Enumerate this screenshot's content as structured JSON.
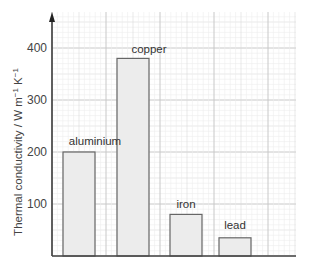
{
  "chart_data": {
    "type": "bar",
    "title": "",
    "xlabel": "",
    "ylabel": "Thermal conductivity / W m⁻¹ K⁻¹",
    "categories": [
      "aluminium",
      "copper",
      "iron",
      "lead"
    ],
    "values": [
      200,
      380,
      80,
      35
    ],
    "yticks": [
      100,
      200,
      300,
      400
    ],
    "ylim": [
      0,
      460
    ],
    "grid": true,
    "grid_style": "graph paper (major every 100, minor every 10)",
    "bar_color": "#ececec",
    "bar_edge_color": "#666666",
    "legend": null
  },
  "labels": {
    "ylabel_main": "Thermal conductivity / W m",
    "ylabel_exp1": "−1",
    "ylabel_mid": " K",
    "ylabel_exp2": "−1",
    "tick_100": "100",
    "tick_200": "200",
    "tick_300": "300",
    "tick_400": "400",
    "bar_0": "aluminium",
    "bar_1": "copper",
    "bar_2": "iron",
    "bar_3": "lead"
  }
}
